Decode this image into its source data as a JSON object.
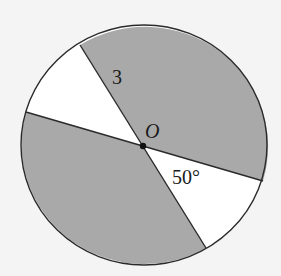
{
  "diagram": {
    "type": "circle-sectors",
    "center_label": "O",
    "radius_label": "3",
    "angle_label": "50°",
    "colors": {
      "background": "#f4f4f4",
      "shaded": "#a9a9a9",
      "unshaded": "#ffffff",
      "stroke": "#2a2a2a"
    }
  }
}
